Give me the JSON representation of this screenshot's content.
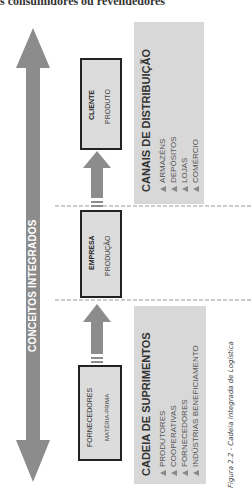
{
  "header": {
    "partial_text": "s consumidores ou revendedores"
  },
  "diagram": {
    "main_arrow": {
      "label": "CONCEITOS INTEGRADOS",
      "color": "#8c8c8c"
    },
    "boxes": [
      {
        "title": "FORNECEDORES",
        "subtitle": "MATÉRIA-PRIMA"
      },
      {
        "title": "EMPRESA",
        "subtitle": "PRODUÇÃO"
      },
      {
        "title": "CLIENTE",
        "subtitle": "PRODUTO"
      }
    ],
    "panels": {
      "supply": {
        "title": "CADEIA DE SUPRIMENTOS",
        "items": [
          "PRODUTORES",
          "COOPERATIVAS",
          "FORNECEDORES",
          "INDÚSTRIAS BENEFICIAMENTO"
        ]
      },
      "distribution": {
        "title": "CANAIS DE DISTRIBUIÇÃO",
        "items": [
          "ARMAZÉNS",
          "DEPÓSITOS",
          "LOJAS",
          "COMÉRCIO"
        ]
      }
    },
    "caption": "Figura 2.2 - Cadeia Integrada de Logística"
  }
}
